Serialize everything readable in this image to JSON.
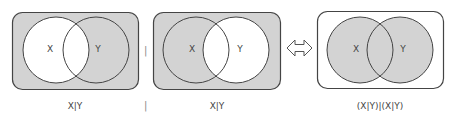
{
  "diagrams": [
    {
      "expression": "X|Y",
      "circle_x_label": "X",
      "circle_y_label": "Y",
      "background_fill": "#d3d3d3",
      "x_only_fill": "#ffffff",
      "intersection_fill": "#ffffff",
      "y_only_fill": "#d3d3d3"
    },
    {
      "expression": "X|Y",
      "circle_x_label": "X",
      "circle_y_label": "Y",
      "background_fill": "#d3d3d3",
      "x_only_fill": "#d3d3d3",
      "intersection_fill": "#ffffff",
      "y_only_fill": "#ffffff"
    },
    {
      "expression": "(X|Y)|(X|Y)",
      "circle_x_label": "X",
      "circle_y_label": "Y",
      "background_fill": "#ffffff",
      "x_only_fill": "#d3d3d3",
      "intersection_fill": "#d3d3d3",
      "y_only_fill": "#d3d3d3"
    }
  ],
  "operator_between_1_2": "|",
  "operator_label_between": "|",
  "equivalence_symbol": "⇔",
  "colors": {
    "shade": "#d3d3d3",
    "outline": "#444444",
    "white": "#ffffff"
  }
}
